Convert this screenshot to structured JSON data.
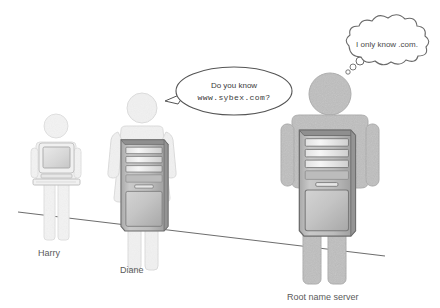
{
  "figure": {
    "background_color": "#ffffff",
    "ground_line_color": "#6e6e6e"
  },
  "speech_bubble": {
    "name": "speech-bubble",
    "line1": "Do you know",
    "line2": "www.sybex.com?",
    "speaker": "Diane",
    "outline_color": "#555555",
    "fill_color": "#ffffff",
    "text_color": "#3a3a3a"
  },
  "thought_bubble": {
    "name": "thought-bubble",
    "line1": "I only know .com.",
    "thinker": "Root name server",
    "outline_color": "#6a6a6a",
    "fill_color": "#ffffff",
    "text_color": "#4a4a4a"
  },
  "people": [
    {
      "id": "harry",
      "label": "Harry",
      "device": "crt-monitor-keyboard",
      "body_color": "#f2f2f2",
      "body_outline": "#dcdcdc",
      "scale": "small"
    },
    {
      "id": "diane",
      "label": "Diane",
      "device": "tower-pc",
      "body_color": "#f0f0f0",
      "body_outline": "#d8d8d8",
      "scale": "medium"
    },
    {
      "id": "root-name-server",
      "label": "Root name server",
      "device": "tower-pc",
      "body_color": "#c2c2c2",
      "body_outline": "#ababab",
      "scale": "large"
    }
  ],
  "computer_colors": {
    "case_body": "#b9b9b9",
    "case_outline": "#6f6f6f",
    "case_dark_edge": "#8d8d8d",
    "bay_fill": "#efefef",
    "panel_fill": "#c8c8c8",
    "monitor_screen": "#dcdcdc",
    "monitor_bezel": "#ededed"
  }
}
